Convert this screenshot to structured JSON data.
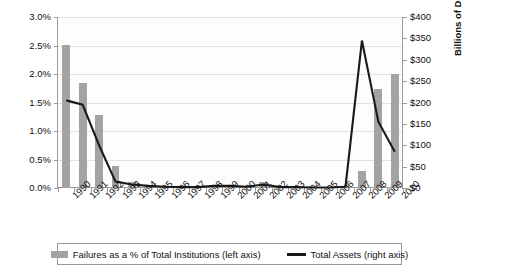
{
  "chart_data": {
    "type": "bar",
    "title": "",
    "subtitle": "",
    "xlabel": "",
    "ylabel": "",
    "ylabel_right": "Billions of Dollars",
    "grid": true,
    "legend_position": "bottom",
    "categories": [
      "1990",
      "1991",
      "1992",
      "1993",
      "1994",
      "1995",
      "1996",
      "1997",
      "1998",
      "1999",
      "2000",
      "2001",
      "2002",
      "2003",
      "2004",
      "2005",
      "2006",
      "2007",
      "2008",
      "2009",
      "2010"
    ],
    "y_axis_left": {
      "label": "",
      "ticks": [
        "0.0%",
        "0.5%",
        "1.0%",
        "1.5%",
        "2.0%",
        "2.5%",
        "3.0%"
      ],
      "tick_values": [
        0,
        0.5,
        1.0,
        1.5,
        2.0,
        2.5,
        3.0
      ],
      "ylim": [
        0,
        3.0
      ],
      "unit": "%"
    },
    "y_axis_right": {
      "label": "Billions of Dollars",
      "ticks": [
        "$0",
        "$50",
        "$100",
        "$150",
        "$200",
        "$250",
        "$300",
        "$350",
        "$400"
      ],
      "tick_values": [
        0,
        50,
        100,
        150,
        200,
        250,
        300,
        350,
        400
      ],
      "ylim": [
        0,
        400
      ],
      "unit": "Billions of Dollars"
    },
    "series": [
      {
        "name": "Failures as a % of Total Institutions (left axis)",
        "type": "bar",
        "axis": "left",
        "color": "#a3a3a3",
        "values": [
          2.51,
          1.85,
          1.28,
          0.38,
          0.11,
          0.05,
          0.04,
          0.01,
          0.0,
          0.06,
          0.05,
          0.02,
          0.1,
          0.01,
          0.02,
          0.0,
          0.0,
          0.03,
          0.29,
          1.73,
          2.0
        ]
      },
      {
        "name": "Total Assets (right axis)",
        "type": "line",
        "axis": "right",
        "color": "#1a1a1a",
        "values": [
          205,
          195,
          100,
          15,
          8,
          5,
          3,
          2,
          2,
          5,
          5,
          3,
          8,
          2,
          2,
          1,
          1,
          3,
          345,
          155,
          85
        ]
      }
    ]
  },
  "legend": {
    "items": [
      {
        "label": "Failures as a % of Total Institutions (left axis)",
        "marker": "bar-swatch"
      },
      {
        "label": "Total Assets (right axis)",
        "marker": "line-swatch"
      }
    ]
  },
  "colors": {
    "bar": "#a3a3a3",
    "line": "#1a1a1a",
    "grid": "#e2e2e2",
    "axis": "#9a9a9a",
    "plot_background": "#fdfdfd",
    "page_background": "#ffffff",
    "text": "#111111"
  }
}
